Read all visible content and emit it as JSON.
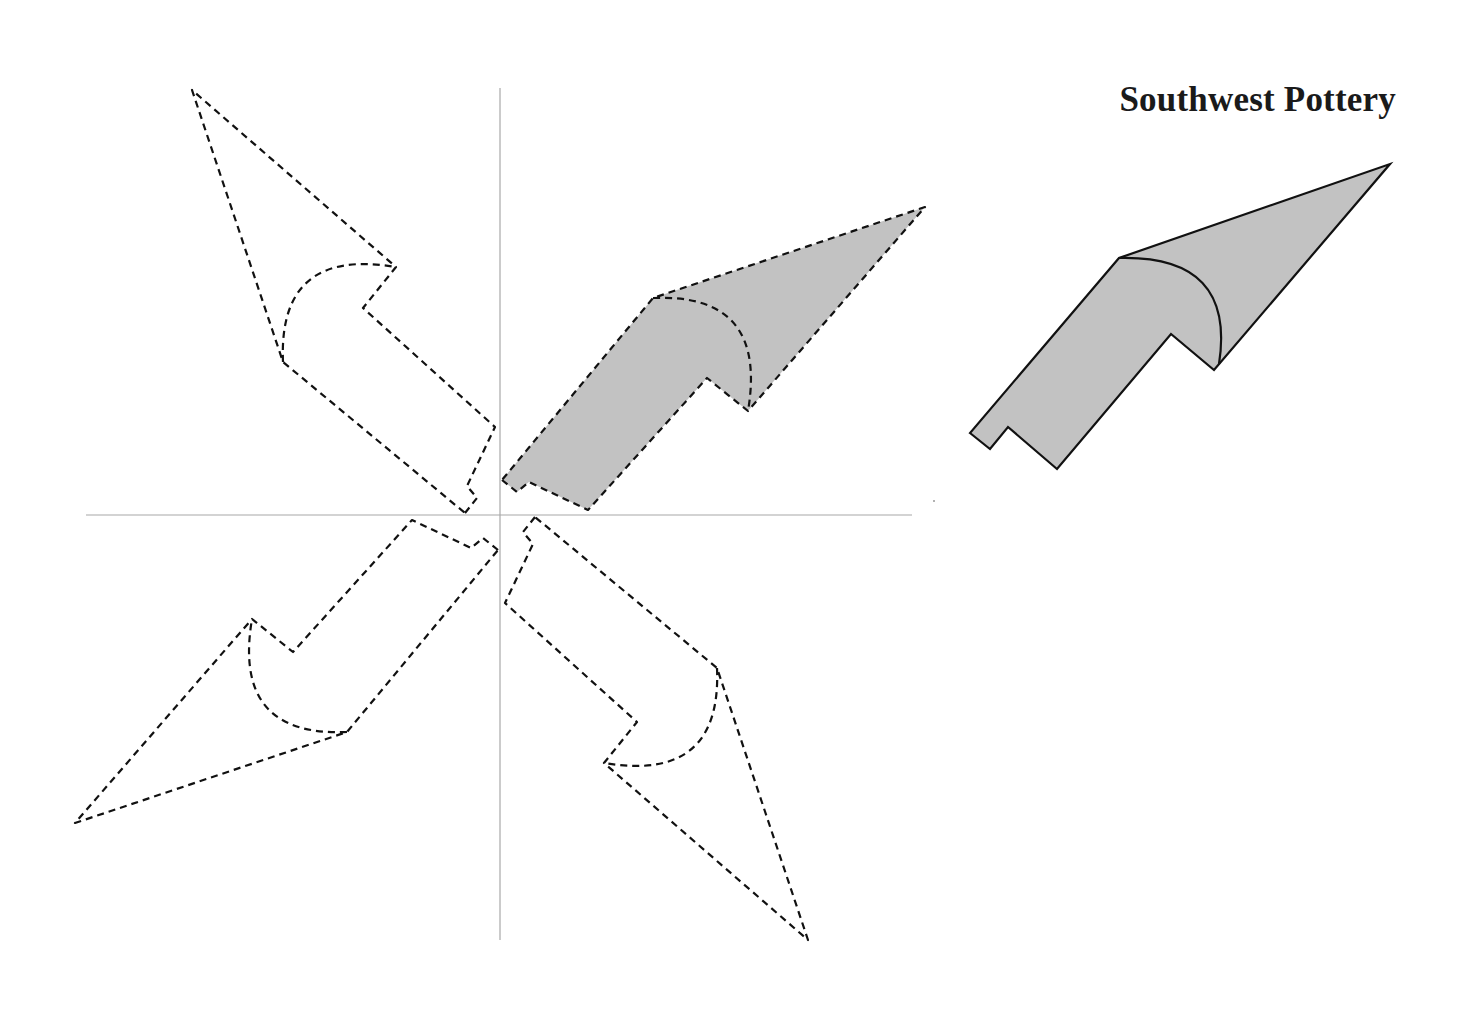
{
  "title": "Southwest Pottery",
  "colors": {
    "background": "#ffffff",
    "shape_fill": "#c2c2c2",
    "outline": "#111111",
    "axis": "#a8a8a8"
  },
  "axes": {
    "origin": [
      500,
      515
    ],
    "x_axis": {
      "from": 86,
      "to": 912
    },
    "y_axis": {
      "from": 88,
      "to": 940
    }
  },
  "motif": {
    "description": "Pottery design motif: shaded shape in quadrant I rotated 90°, 180°, 270° about the origin (dashed outlines)",
    "local_vertices": [
      [
        2,
        35
      ],
      [
        17,
        23
      ],
      [
        29,
        33
      ],
      [
        88,
        5
      ],
      [
        207,
        137
      ],
      [
        248,
        104
      ],
      [
        425,
        308
      ],
      [
        153,
        217
      ]
    ],
    "curve": {
      "from": [
        153,
        217
      ],
      "control": [
        265,
        215
      ],
      "to": [
        248,
        104
      ]
    },
    "rotations_deg": [
      0,
      90,
      180,
      270
    ],
    "shaded_rotation_deg": 0
  },
  "reference_shape": {
    "label": "original figure",
    "style": "solid outline, gray fill"
  }
}
